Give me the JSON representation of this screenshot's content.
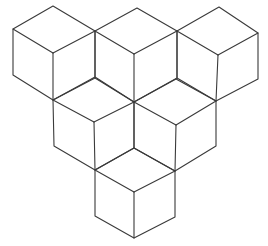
{
  "diagram": {
    "title": "",
    "stroke_color": "#3a3a3a",
    "background": "#ffffff",
    "cubes": [
      {
        "id": "cube-row1-left",
        "top": [
          53,
          6
        ],
        "left": [
          13,
          29
        ],
        "right": [
          95,
          31
        ],
        "center": [
          53,
          53
        ],
        "bottom_left": [
          13,
          75
        ],
        "bottom": [
          53,
          100
        ],
        "bottom_right": [
          95,
          77
        ]
      },
      {
        "id": "cube-row1-middle",
        "top": [
          137,
          8
        ],
        "left": [
          95,
          31
        ],
        "right": [
          177,
          31
        ],
        "center": [
          134,
          54
        ],
        "bottom_left": [
          95,
          77
        ],
        "bottom": [
          134,
          102
        ],
        "bottom_right": [
          177,
          78
        ]
      },
      {
        "id": "cube-row1-right",
        "top": [
          219,
          7
        ],
        "left": [
          177,
          31
        ],
        "right": [
          258,
          33
        ],
        "center": [
          218,
          55
        ],
        "bottom_left": [
          177,
          78
        ],
        "bottom": [
          216,
          101
        ],
        "bottom_right": [
          258,
          79
        ]
      },
      {
        "id": "cube-row2-left",
        "top": [
          95,
          78
        ],
        "left": [
          53,
          100
        ],
        "right": [
          134,
          102
        ],
        "center": [
          94,
          122
        ],
        "bottom_left": [
          54,
          146
        ],
        "bottom": [
          95,
          170
        ],
        "bottom_right": [
          134,
          148
        ]
      },
      {
        "id": "cube-row2-right",
        "top": [
          176,
          79
        ],
        "left": [
          134,
          102
        ],
        "right": [
          216,
          101
        ],
        "center": [
          176,
          125
        ],
        "bottom_left": [
          134,
          148
        ],
        "bottom": [
          175,
          171
        ],
        "bottom_right": [
          216,
          146
        ]
      },
      {
        "id": "cube-row3-bottom",
        "top": [
          134,
          148
        ],
        "left": [
          95,
          170
        ],
        "right": [
          175,
          171
        ],
        "center": [
          134,
          192
        ],
        "bottom_left": [
          95,
          216
        ],
        "bottom": [
          134,
          238
        ],
        "bottom_right": [
          175,
          217
        ]
      }
    ]
  }
}
